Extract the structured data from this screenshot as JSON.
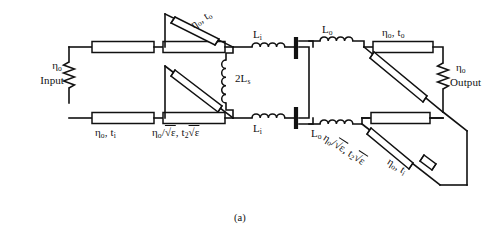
{
  "figure": {
    "caption": "(a)",
    "type": "circuit-schematic"
  },
  "ports": {
    "input": {
      "impedance": "η",
      "impedance_sub": "o",
      "label": "Input",
      "element": "resistor"
    },
    "output": {
      "impedance": "η",
      "impedance_sub": "o",
      "label": "Output",
      "element": "resistor"
    }
  },
  "transmission_lines": {
    "input_bottom_1": {
      "impedance": "η",
      "impedance_sub": "o",
      "delay": "t",
      "delay_sub": "i",
      "text": "ηo, ti"
    },
    "input_bottom_2": {
      "text_pre": "η",
      "text_pre_sub": "o",
      "text_mid": "/√ε,",
      "text_post": "t",
      "text_post_sub": "2",
      "text_end": "√ε",
      "text": "ηo/√ε, t2√ε"
    },
    "diag_top": {
      "impedance": "η",
      "impedance_sub": "o",
      "delay": "t",
      "delay_sub": "o",
      "text": "ηo, to"
    },
    "output_top": {
      "impedance": "η",
      "impedance_sub": "o",
      "delay": "t",
      "delay_sub": "o",
      "text": "ηo, to"
    },
    "diag_bottom_1": {
      "text": "ηo/√ε, t2√ε"
    },
    "diag_bottom_2": {
      "impedance": "η",
      "impedance_sub": "o",
      "delay": "t",
      "delay_sub": "i",
      "text": "ηo, ti"
    }
  },
  "inductors": {
    "li_top": {
      "label": "L",
      "sub": "i"
    },
    "li_bottom": {
      "label": "L",
      "sub": "i"
    },
    "lo_top": {
      "label": "L",
      "sub": "o"
    },
    "lo_bottom": {
      "label": "L",
      "sub": "o"
    },
    "ls_shunt": {
      "label": "2L",
      "sub": "s"
    }
  },
  "capacitors": {
    "top_plate": {
      "name": "series-capacitor-top"
    },
    "bottom_plate": {
      "name": "series-capacitor-bottom"
    }
  },
  "symbols": {
    "eta": "η",
    "sqrt_eps": "√ε",
    "slash": "/",
    "comma": ","
  },
  "colors": {
    "ink": "#111111",
    "paper": "#ffffff"
  }
}
